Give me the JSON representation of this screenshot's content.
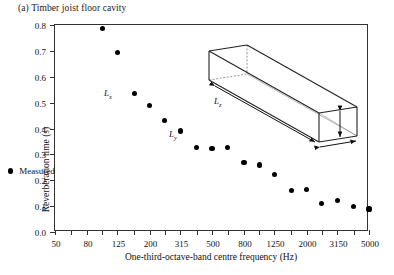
{
  "caption": "(a) Timber joist floor cavity",
  "legend": {
    "marker_name": "filled-circle",
    "label": "Measured"
  },
  "inset": {
    "shape": "elongated-rectangular-cuboid",
    "labels": {
      "lx": "L",
      "lx_sub": "x",
      "ly": "L",
      "ly_sub": "y",
      "lz": "L",
      "lz_sub": "z"
    }
  },
  "colors": {
    "marker": "#000000",
    "axis": "#333333",
    "text": "#111111"
  },
  "chart_data": {
    "type": "scatter",
    "title": "(a) Timber joist floor cavity",
    "xlabel": "One-third-octave-band centre frequency (Hz)",
    "ylabel": "Reverberation time (s)",
    "xscale": "log",
    "xlim": [
      50,
      5000
    ],
    "ylim": [
      0.0,
      0.8
    ],
    "ytick_labels": [
      "0.0",
      "0.1",
      "0.2",
      "0.3",
      "0.4",
      "0.5",
      "0.6",
      "0.7",
      "0.8"
    ],
    "ytick_values": [
      0.0,
      0.1,
      0.2,
      0.3,
      0.4,
      0.5,
      0.6,
      0.7,
      0.8
    ],
    "xtick_values": [
      50,
      63,
      80,
      100,
      125,
      160,
      200,
      250,
      315,
      400,
      500,
      630,
      800,
      1000,
      1250,
      1600,
      2000,
      2500,
      3150,
      4000,
      5000
    ],
    "xtick_labels": [
      "50",
      "",
      "80",
      "",
      "125",
      "",
      "200",
      "",
      "315",
      "",
      "500",
      "",
      "800",
      "",
      "1250",
      "",
      "2000",
      "",
      "3150",
      "",
      "5000"
    ],
    "grid": false,
    "legend_position": "lower-left-inside",
    "series": [
      {
        "name": "Measured",
        "marker": "filled-circle",
        "x": [
          100,
          125,
          160,
          200,
          250,
          315,
          400,
          500,
          630,
          800,
          1000,
          1250,
          1600,
          2000,
          2500,
          3150,
          4000,
          5000
        ],
        "values": [
          0.785,
          0.695,
          0.535,
          0.488,
          0.43,
          0.39,
          0.327,
          0.322,
          0.327,
          0.268,
          0.259,
          0.222,
          0.16,
          0.163,
          0.11,
          0.121,
          0.1,
          0.089
        ]
      }
    ]
  }
}
